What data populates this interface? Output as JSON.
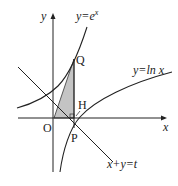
{
  "diagram": {
    "curves": [
      {
        "name": "exp",
        "label": "y=e",
        "sup": "x"
      },
      {
        "name": "ln",
        "label": "y=ln x"
      }
    ],
    "line": {
      "label": "x+y=t"
    },
    "axes": {
      "x_label": "x",
      "y_label": "y",
      "origin_label": "O"
    },
    "points": {
      "Q": "Q",
      "H": "H",
      "P": "P"
    },
    "shade_color": "#bdbdbd"
  }
}
